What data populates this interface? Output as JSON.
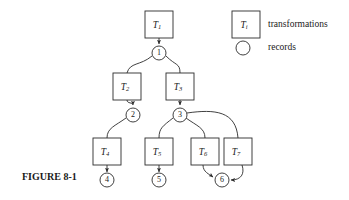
{
  "figure": {
    "caption": "FIGURE 8-1",
    "caption_x": 22,
    "caption_y": 178
  },
  "legend": {
    "box_symbol_label": "T",
    "box_symbol_sub": "i",
    "box_text": "transformations",
    "circle_text": "records",
    "box": {
      "x": 232,
      "y": 11,
      "w": 28,
      "h": 27
    },
    "box_text_x": 268,
    "box_text_y": 25,
    "circle": {
      "cx": 243,
      "cy": 48,
      "r": 7
    },
    "circle_text_x": 268,
    "circle_text_y": 48
  },
  "style": {
    "stroke_color": "#2b2b2b",
    "fill_color": "#ffffff",
    "background": "#ffffff",
    "text_color": "#1a1a1a"
  },
  "transformations": [
    {
      "id": "T1",
      "label": "T",
      "sub": "1",
      "x": 145,
      "y": 11,
      "w": 28,
      "h": 27
    },
    {
      "id": "T2",
      "label": "T",
      "sub": "2",
      "x": 113,
      "y": 73,
      "w": 28,
      "h": 27
    },
    {
      "id": "T3",
      "label": "T",
      "sub": "3",
      "x": 166,
      "y": 73,
      "w": 28,
      "h": 27
    },
    {
      "id": "T4",
      "label": "T",
      "sub": "4",
      "x": 93,
      "y": 138,
      "w": 28,
      "h": 27
    },
    {
      "id": "T5",
      "label": "T",
      "sub": "5",
      "x": 145,
      "y": 138,
      "w": 28,
      "h": 27
    },
    {
      "id": "T6",
      "label": "T",
      "sub": "6",
      "x": 191,
      "y": 138,
      "w": 28,
      "h": 27
    },
    {
      "id": "T7",
      "label": "T",
      "sub": "7",
      "x": 224,
      "y": 138,
      "w": 28,
      "h": 27
    }
  ],
  "records": [
    {
      "id": "R1",
      "label": "1",
      "cx": 159,
      "cy": 53,
      "r": 7
    },
    {
      "id": "R2",
      "label": "2",
      "cx": 133,
      "cy": 115,
      "r": 7
    },
    {
      "id": "R3",
      "label": "3",
      "cx": 180,
      "cy": 115,
      "r": 7
    },
    {
      "id": "R4",
      "label": "4",
      "cx": 107,
      "cy": 180,
      "r": 7
    },
    {
      "id": "R5",
      "label": "5",
      "cx": 159,
      "cy": 180,
      "r": 7
    },
    {
      "id": "R6",
      "label": "6",
      "cx": 222,
      "cy": 180,
      "r": 7
    }
  ],
  "edges": [
    {
      "id": "T1-to-R1",
      "from": "T1",
      "to": "R1",
      "path": "M 159 38 L 159 44",
      "arrow": true
    },
    {
      "id": "R1-to-T2",
      "from": "R1",
      "to": "T2",
      "path": "M 152 56 C 140 66 130 62 127 73",
      "arrow": false
    },
    {
      "id": "R1-to-T3",
      "from": "R1",
      "to": "T3",
      "path": "M 166 56 C 176 66 180 63 180 73",
      "arrow": false
    },
    {
      "id": "T2-to-R2",
      "from": "T2",
      "to": "R2",
      "path": "M 127 100 C 127 105 133 103 133 106",
      "arrow": true
    },
    {
      "id": "T3-to-R3",
      "from": "T3",
      "to": "R3",
      "path": "M 180 100 L 180 106",
      "arrow": true
    },
    {
      "id": "R2-to-T4",
      "from": "R2",
      "to": "T4",
      "path": "M 126 118 C 115 126 107 128 107 138",
      "arrow": false
    },
    {
      "id": "R3-to-T5",
      "from": "R3",
      "to": "T5",
      "path": "M 173 118 C 163 126 159 128 159 138",
      "arrow": false
    },
    {
      "id": "R3-to-T6",
      "from": "R3",
      "to": "T6",
      "path": "M 186 118 C 197 126 205 128 205 138",
      "arrow": false
    },
    {
      "id": "R3-to-T7",
      "from": "R3",
      "to": "T7",
      "path": "M 187 113 C 215 110 236 111 238 138",
      "arrow": false
    },
    {
      "id": "T4-to-R4",
      "from": "T4",
      "to": "R4",
      "path": "M 107 165 L 107 173",
      "arrow": true
    },
    {
      "id": "T5-to-R5",
      "from": "T5",
      "to": "R5",
      "path": "M 159 165 L 159 173",
      "arrow": true
    },
    {
      "id": "T6-to-R6",
      "from": "T6",
      "to": "R6",
      "path": "M 203 165 C 203 172 210 174 214 177",
      "arrow": true
    },
    {
      "id": "T7-to-R6",
      "from": "T7",
      "to": "R6",
      "path": "M 242 165 C 245 174 240 180 230 180",
      "arrow": true
    }
  ]
}
